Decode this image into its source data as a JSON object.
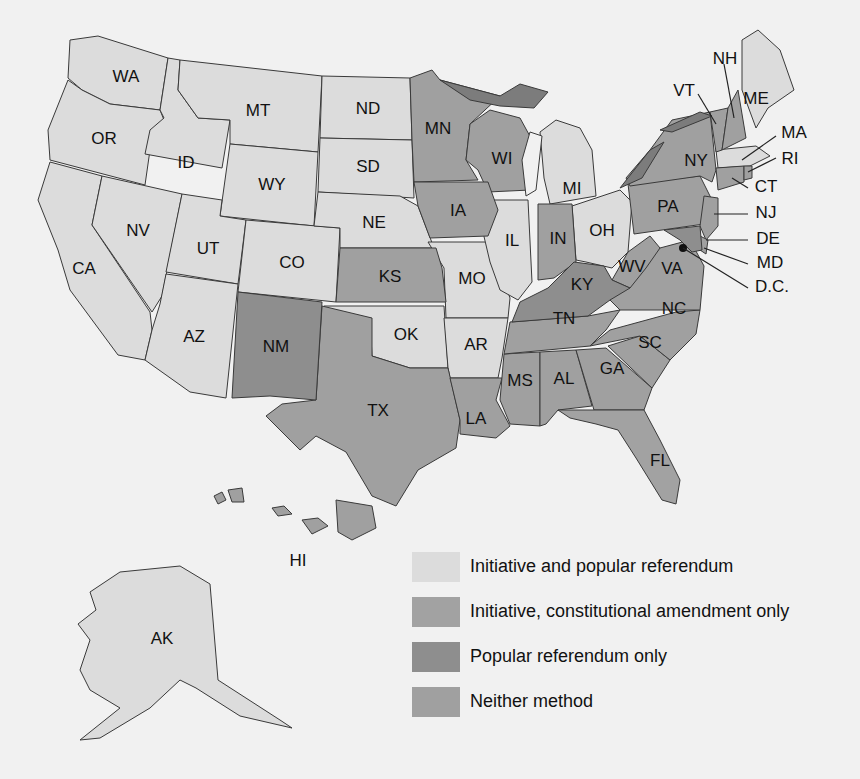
{
  "colors": {
    "background": "#f1f1f1",
    "initiative_and_referendum": "#dcdcdc",
    "initiative_constitutional_only": "#a2a2a2",
    "popular_referendum_only": "#8e8e8e",
    "neither": "#a0a0a0",
    "lake_edge": "#7c7c7c",
    "outline": "#3a3a3a"
  },
  "legend": [
    {
      "id": "initiative_and_referendum",
      "label": "Initiative and popular referendum",
      "color": "#dcdcdc"
    },
    {
      "id": "initiative_constitutional_only",
      "label": "Initiative, constitutional amendment only",
      "color": "#a2a2a2"
    },
    {
      "id": "popular_referendum_only",
      "label": "Popular referendum only",
      "color": "#8e8e8e"
    },
    {
      "id": "neither",
      "label": "Neither method",
      "color": "#a0a0a0"
    }
  ],
  "states": {
    "WA": "WA",
    "OR": "OR",
    "CA": "CA",
    "ID": "ID",
    "NV": "NV",
    "MT": "MT",
    "WY": "WY",
    "UT": "UT",
    "AZ": "AZ",
    "CO": "CO",
    "NM": "NM",
    "ND": "ND",
    "SD": "SD",
    "NE": "NE",
    "KS": "KS",
    "OK": "OK",
    "TX": "TX",
    "MN": "MN",
    "IA": "IA",
    "MO": "MO",
    "AR": "AR",
    "LA": "LA",
    "WI": "WI",
    "IL": "IL",
    "MI": "MI",
    "IN": "IN",
    "OH": "OH",
    "KY": "KY",
    "TN": "TN",
    "MS": "MS",
    "AL": "AL",
    "GA": "GA",
    "FL": "FL",
    "SC": "SC",
    "NC": "NC",
    "VA": "VA",
    "WV": "WV",
    "PA": "PA",
    "NY": "NY",
    "VT": "VT",
    "NH": "NH",
    "ME": "ME",
    "MA": "MA",
    "RI": "RI",
    "CT": "CT",
    "NJ": "NJ",
    "DE": "DE",
    "MD": "MD",
    "DC": "D.C.",
    "AK": "AK",
    "HI": "HI"
  }
}
